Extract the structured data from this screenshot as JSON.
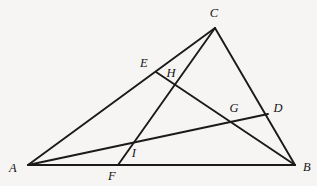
{
  "figure": {
    "background_color": "#f6f5f3",
    "stroke_color": "#1a1a1a",
    "stroke_width": 1.9,
    "width": 317,
    "height": 186
  },
  "points": {
    "A": {
      "label": "A",
      "x": 28,
      "y": 165,
      "label_x": 13,
      "label_y": 168
    },
    "B": {
      "label": "B",
      "x": 295,
      "y": 165,
      "label_x": 307,
      "label_y": 167
    },
    "C": {
      "label": "C",
      "x": 215,
      "y": 28,
      "label_x": 214,
      "label_y": 13
    },
    "D": {
      "label": "D",
      "x": 268,
      "y": 114,
      "label_x": 278,
      "label_y": 108
    },
    "E": {
      "label": "E",
      "x": 156,
      "y": 72,
      "label_x": 144,
      "label_y": 63
    },
    "F": {
      "label": "F",
      "x": 118,
      "y": 165,
      "label_x": 112,
      "label_y": 176
    },
    "G": {
      "label": "G",
      "x": 238,
      "y": 119,
      "label_x": 234,
      "label_y": 108
    },
    "H": {
      "label": "H",
      "x": 173,
      "y": 82,
      "label_x": 171,
      "label_y": 73
    },
    "I": {
      "label": "I",
      "x": 128,
      "y": 146,
      "label_x": 134,
      "label_y": 153
    }
  },
  "segments": [
    {
      "name": "side-AB",
      "from": "A",
      "to": "B"
    },
    {
      "name": "side-AC",
      "from": "A",
      "to": "C"
    },
    {
      "name": "side-CB",
      "from": "C",
      "to": "B"
    },
    {
      "name": "cevian-CF",
      "from": "C",
      "to": "F"
    },
    {
      "name": "cevian-AD",
      "from": "A",
      "to": "D"
    },
    {
      "name": "cevian-EB",
      "from": "E",
      "to": "B"
    }
  ]
}
